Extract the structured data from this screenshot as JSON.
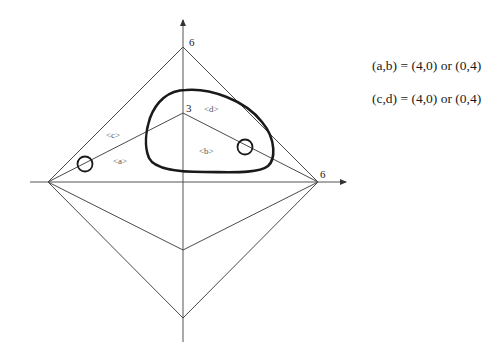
{
  "diagram": {
    "axes": {
      "y_top_label": "6",
      "y_mid_label": "3",
      "x_right_label": "6"
    },
    "region_labels": {
      "a": "<a>",
      "b": "<b>",
      "c": "<c>",
      "d": "<d>"
    },
    "equations": [
      "(a,b) = (4,0) or (0,4)",
      "(c,d) = (4,0) or (0,4)"
    ],
    "colors": {
      "line": "#4a4a4a",
      "curve": "#1a1a1a",
      "background": "#ffffff"
    }
  }
}
